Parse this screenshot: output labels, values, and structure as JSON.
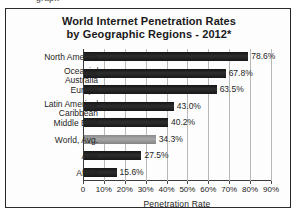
{
  "clipped_header_text": "graph",
  "chart_data": {
    "type": "bar",
    "orientation": "horizontal",
    "title": "World Internet Penetration Rates",
    "subtitle": "by Geographic Regions - 2012*",
    "title_line1": "World Internet Penetration Rates",
    "title_line2": "by Geographic Regions - 2012*",
    "xlabel": "Penetration Rate",
    "ylabel": "",
    "xlim": [
      0,
      90
    ],
    "xticks": [
      0,
      10,
      20,
      30,
      40,
      50,
      60,
      70,
      80,
      90
    ],
    "xtick_labels": [
      "0",
      "10%",
      "20%",
      "30%",
      "40%",
      "50%",
      "60%",
      "70%",
      "80%",
      "90%"
    ],
    "grid": true,
    "legend": false,
    "categories": [
      "North America",
      "Oceania/\nAustralia",
      "Europe",
      "Latin America/\nCaribbean",
      "Middle East",
      "World, Avg.",
      "Asia",
      "Africa"
    ],
    "values": [
      78.6,
      67.8,
      63.5,
      43.0,
      40.2,
      34.3,
      27.5,
      15.6
    ],
    "value_labels": [
      "78.6%",
      "67.8%",
      "63.5%",
      "43.0%",
      "40.2%",
      "34.3%",
      "27.5%",
      "15.6%"
    ],
    "bar_colors": [
      "#1f1f1f",
      "#1f1f1f",
      "#1f1f1f",
      "#1f1f1f",
      "#1f1f1f",
      "#9a9a9a",
      "#1f1f1f",
      "#1f1f1f"
    ],
    "highlight_category": "World, Avg.",
    "colors": {
      "bar_dark": "#1f1f1f",
      "bar_light": "#9a9a9a",
      "grid": "#b9b9b9",
      "axis": "#3a3a3a",
      "text": "#1f1f1f",
      "background": "#ffffff",
      "frame": "#2b2b2b"
    }
  }
}
